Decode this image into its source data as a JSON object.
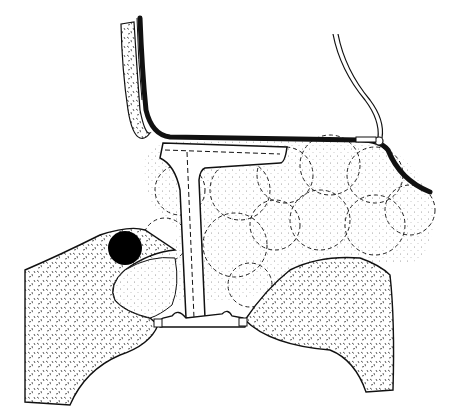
{
  "figure": {
    "width": 455,
    "height": 420,
    "background": "#ffffff",
    "ink": "#111111",
    "stipple": "#555555"
  },
  "elements": {
    "left_stippled_strip": {
      "fill": "stipple"
    },
    "thick_membrane": {
      "color": "#111111"
    },
    "thin_tube_right": {
      "color": "#111111"
    },
    "t_tube": {
      "color": "#111111"
    },
    "lobule_cluster": {
      "count": 12,
      "style": "dashed-dotted"
    },
    "left_tissue_mass": {
      "fill": "stipple"
    },
    "right_tissue_mass": {
      "fill": "stipple"
    },
    "dark_marker": {
      "color": "#000000",
      "cx": 125,
      "cy": 248,
      "r": 17
    },
    "base_plate": {
      "color": "#111111"
    }
  }
}
